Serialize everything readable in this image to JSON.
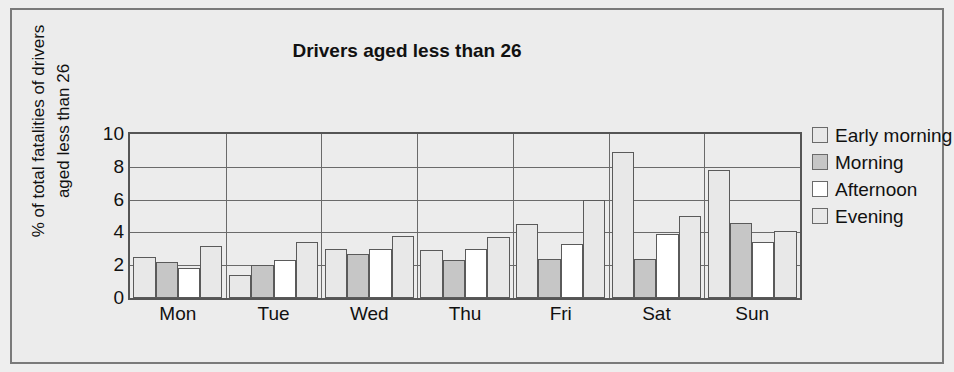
{
  "chart_data": {
    "type": "bar",
    "title": "Drivers aged less than 26",
    "xlabel": "",
    "ylabel": "% of total fatalities of drivers aged less than 26",
    "ylabel_lines": [
      "% of total fatalities of drivers",
      "aged less than 26"
    ],
    "categories": [
      "Mon",
      "Tue",
      "Wed",
      "Thu",
      "Fri",
      "Sat",
      "Sun"
    ],
    "series": [
      {
        "name": "Early morning",
        "color": "#e8e8e8",
        "values": [
          2.5,
          1.4,
          3.0,
          2.9,
          4.5,
          8.9,
          7.8
        ]
      },
      {
        "name": "Morning",
        "color": "#c6c6c6",
        "values": [
          2.2,
          2.0,
          2.7,
          2.3,
          2.4,
          2.4,
          4.6
        ]
      },
      {
        "name": "Afternoon",
        "color": "#ffffff",
        "values": [
          1.8,
          2.3,
          3.0,
          3.0,
          3.3,
          3.9,
          3.4
        ]
      },
      {
        "name": "Evening",
        "color": "#e8e8e8",
        "values": [
          3.2,
          3.4,
          3.8,
          3.7,
          6.0,
          5.0,
          4.1
        ]
      }
    ],
    "ylim": [
      0,
      10
    ],
    "yticks": [
      0,
      2,
      4,
      6,
      8,
      10
    ],
    "ytick_labels": [
      "0",
      "2",
      "4",
      "6",
      "8",
      "10"
    ],
    "grid": "horizontal-and-category-separators",
    "legend_position": "right",
    "legend": [
      "Early morning",
      "Morning",
      "Afternoon",
      "Evening"
    ]
  },
  "colors": {
    "page_background": "#ececec",
    "frame_border": "#7a7a7a",
    "axis": "#555555",
    "gridline": "#6a6a6a",
    "text": "#111111"
  }
}
